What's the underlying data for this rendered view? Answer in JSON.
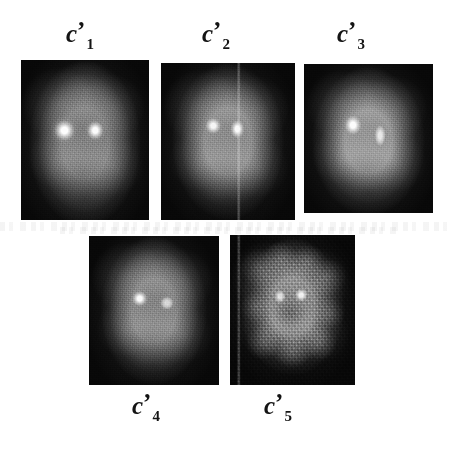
{
  "figure": {
    "background_color": "#ffffff",
    "label_color": "#141414",
    "panel_count": 5,
    "symbol_base": "c",
    "symbol_prime": "’"
  },
  "panels": [
    {
      "id": "panel-1",
      "label_base": "c",
      "label_prime": "’",
      "label_subscript": "1",
      "label_full": "c’1",
      "label_position": "top",
      "x": 21,
      "y": 60,
      "width": 128,
      "height": 160,
      "label_x": 66,
      "label_y": 21,
      "has_seam": false,
      "grain": "fine",
      "head_cx": 50,
      "head_cy": 52,
      "head_rx": 44,
      "head_ry": 52,
      "head_brightness": "#7d7d7d",
      "hotspots": [
        {
          "cx": 34,
          "cy": 44,
          "rx": 11,
          "ry": 9,
          "peak": "#fdfdfd"
        },
        {
          "cx": 58,
          "cy": 44,
          "rx": 9,
          "ry": 8,
          "peak": "#fbfbfb"
        }
      ]
    },
    {
      "id": "panel-2",
      "label_base": "c",
      "label_prime": "’",
      "label_subscript": "2",
      "label_full": "c’2",
      "label_position": "top",
      "x": 161,
      "y": 63,
      "width": 134,
      "height": 157,
      "label_x": 202,
      "label_y": 21,
      "has_seam": true,
      "seam_percent": 58,
      "grain": "fine",
      "head_cx": 50,
      "head_cy": 50,
      "head_rx": 42,
      "head_ry": 50,
      "head_brightness": "#8a8a8a",
      "hotspots": [
        {
          "cx": 39,
          "cy": 40,
          "rx": 8,
          "ry": 7,
          "peak": "#f6f6f6"
        },
        {
          "cx": 57,
          "cy": 42,
          "rx": 7,
          "ry": 8,
          "peak": "#fafafa"
        }
      ]
    },
    {
      "id": "panel-3",
      "label_base": "c",
      "label_prime": "’",
      "label_subscript": "3",
      "label_full": "c’3",
      "label_position": "top",
      "x": 304,
      "y": 64,
      "width": 129,
      "height": 149,
      "label_x": 337,
      "label_y": 21,
      "has_seam": false,
      "grain": "fine",
      "head_cx": 50,
      "head_cy": 52,
      "head_rx": 44,
      "head_ry": 50,
      "head_brightness": "#949494",
      "hotspots": [
        {
          "cx": 38,
          "cy": 41,
          "rx": 9,
          "ry": 9,
          "peak": "#fcfcfc"
        },
        {
          "cx": 59,
          "cy": 48,
          "rx": 6,
          "ry": 10,
          "peak": "#e8e8e8"
        }
      ]
    },
    {
      "id": "panel-4",
      "label_base": "c",
      "label_prime": "’",
      "label_subscript": "4",
      "label_full": "c’4",
      "label_position": "bottom",
      "x": 89,
      "y": 236,
      "width": 130,
      "height": 149,
      "label_x": 132,
      "label_y": 393,
      "has_seam": false,
      "grain": "fine",
      "head_cx": 50,
      "head_cy": 50,
      "head_rx": 41,
      "head_ry": 50,
      "head_brightness": "#838383",
      "hotspots": [
        {
          "cx": 39,
          "cy": 42,
          "rx": 8,
          "ry": 7,
          "peak": "#fbfbfb"
        },
        {
          "cx": 60,
          "cy": 45,
          "rx": 7,
          "ry": 6,
          "peak": "#d8d8d8"
        }
      ]
    },
    {
      "id": "panel-5",
      "label_base": "c",
      "label_prime": "’",
      "label_subscript": "5",
      "label_full": "c’5",
      "label_position": "bottom",
      "x": 230,
      "y": 235,
      "width": 125,
      "height": 150,
      "label_x": 264,
      "label_y": 393,
      "has_seam": true,
      "seam_percent": 7,
      "grain": "coarse",
      "head_cx": 50,
      "head_cy": 48,
      "head_rx": 42,
      "head_ry": 46,
      "head_brightness": "#8f8f8f",
      "hotspots": [
        {
          "cx": 40,
          "cy": 41,
          "rx": 6,
          "ry": 6,
          "peak": "#e2e2e2"
        },
        {
          "cx": 57,
          "cy": 40,
          "rx": 7,
          "ry": 6,
          "peak": "#f2f2f2"
        }
      ]
    }
  ],
  "artifacts": [
    {
      "id": "scan-band-top",
      "x": 0,
      "y": 222,
      "width": 454,
      "height": 9
    },
    {
      "id": "scan-band-bottom",
      "x": 60,
      "y": 227,
      "width": 340,
      "height": 7
    }
  ]
}
